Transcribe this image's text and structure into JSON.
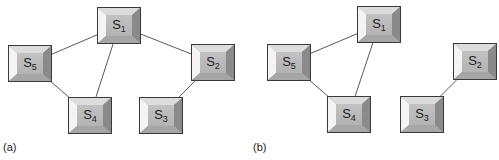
{
  "figure": {
    "panels": [
      {
        "id": "a",
        "caption": "(a)",
        "nodes": [
          {
            "id": "S1",
            "base": "S",
            "sub": "1",
            "x": 97,
            "y": 7
          },
          {
            "id": "S5",
            "base": "S",
            "sub": "5",
            "x": 8,
            "y": 45
          },
          {
            "id": "S4",
            "base": "S",
            "sub": "4",
            "x": 68,
            "y": 97
          },
          {
            "id": "S3",
            "base": "S",
            "sub": "3",
            "x": 139,
            "y": 97
          },
          {
            "id": "S2",
            "base": "S",
            "sub": "2",
            "x": 191,
            "y": 44
          }
        ],
        "edges": [
          [
            "S1",
            "S5"
          ],
          [
            "S1",
            "S4"
          ],
          [
            "S5",
            "S4"
          ],
          [
            "S1",
            "S2"
          ],
          [
            "S2",
            "S3"
          ]
        ]
      },
      {
        "id": "b",
        "caption": "(b)",
        "nodes": [
          {
            "id": "S1",
            "base": "S",
            "sub": "1",
            "x": 107,
            "y": 6
          },
          {
            "id": "S5",
            "base": "S",
            "sub": "5",
            "x": 17,
            "y": 44
          },
          {
            "id": "S4",
            "base": "S",
            "sub": "4",
            "x": 77,
            "y": 96
          },
          {
            "id": "S3",
            "base": "S",
            "sub": "3",
            "x": 150,
            "y": 96
          },
          {
            "id": "S2",
            "base": "S",
            "sub": "2",
            "x": 203,
            "y": 43
          }
        ],
        "edges": [
          [
            "S1",
            "S5"
          ],
          [
            "S1",
            "S4"
          ],
          [
            "S5",
            "S4"
          ],
          [
            "S2",
            "S3"
          ]
        ]
      }
    ]
  },
  "style": {
    "edge_color": "#5a5a5a",
    "node_border": "#3a3a3a",
    "bevel_light": "#f4f4f4",
    "bevel_mid": "#dcdcdc",
    "bevel_dark": "#8a8a8a",
    "face": "#b8b8b8"
  }
}
